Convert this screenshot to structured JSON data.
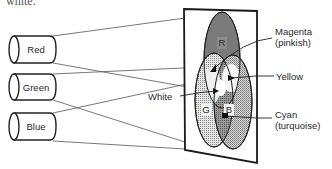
{
  "caption_fragment": "white.",
  "projectors": [
    {
      "label": "Red",
      "color": "#d94040"
    },
    {
      "label": "Green",
      "color": "#3aa040"
    },
    {
      "label": "Blue",
      "color": "#3050c0"
    }
  ],
  "screen": {
    "circles": [
      {
        "letter": "R",
        "fill": "#7a7a7a"
      },
      {
        "letter": "G",
        "fill": "#cfcfcf"
      },
      {
        "letter": "B",
        "fill": "#bdbdbd"
      }
    ]
  },
  "annotations": {
    "magenta": "Magenta",
    "magenta_sub": "(pinkish)",
    "yellow": "Yellow",
    "white": "White",
    "cyan": "Cyan",
    "cyan_sub": "(turquoise)"
  }
}
